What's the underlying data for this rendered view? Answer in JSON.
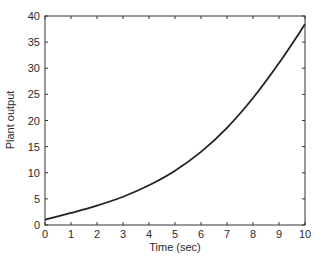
{
  "chart_data": {
    "type": "line",
    "title": "",
    "xlabel": "Time (sec)",
    "ylabel": "Plant output",
    "xlim": [
      0,
      10
    ],
    "ylim": [
      0,
      40
    ],
    "xticks": [
      0,
      1,
      2,
      3,
      4,
      5,
      6,
      7,
      8,
      9,
      10
    ],
    "yticks": [
      0,
      5,
      10,
      15,
      20,
      25,
      30,
      35,
      40
    ],
    "grid": false,
    "legend": null,
    "series": [
      {
        "name": "Plant output",
        "color": "#222222",
        "x": [
          0,
          1,
          2,
          3,
          4,
          5,
          6,
          7,
          8,
          9,
          10
        ],
        "y": [
          1.0,
          2.3,
          3.7,
          5.4,
          7.6,
          10.4,
          14.0,
          18.6,
          24.3,
          31.0,
          38.4
        ]
      }
    ]
  },
  "colors": {
    "axis": "#333333",
    "line": "#222222",
    "background": "#ffffff"
  }
}
